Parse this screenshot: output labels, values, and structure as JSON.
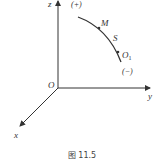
{
  "figure": {
    "caption": "图 11.5",
    "axes": {
      "z": "z",
      "y": "y",
      "x": "x",
      "origin": "O"
    },
    "curve": {
      "points": {
        "M": "M",
        "S": "S",
        "O1_main": "O",
        "O1_sub": "1"
      },
      "positive_direction": "(+)",
      "negative_direction": "(−)"
    }
  },
  "colors": {
    "line": "#333333",
    "text": "#333333"
  }
}
